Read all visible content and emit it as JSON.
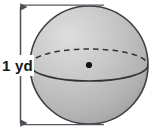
{
  "figure": {
    "kind": "geometry-diagram",
    "shape_name": "sphere",
    "background_color": "#ffffff",
    "dimension": {
      "label": "1 yd",
      "value": 1,
      "unit": "yd",
      "measures": "diameter",
      "orientation": "vertical",
      "arrowheads": "both",
      "line_color": "#4a4f55",
      "label_color": "#15171a"
    },
    "sphere": {
      "outline_color": "#3c4046",
      "fill_light": "#d8d8d8",
      "fill_mid": "#bdbdbd",
      "fill_dark": "#a6a6a6",
      "center_x": 89,
      "center_y": 65,
      "radius_x": 59,
      "radius_y": 59
    },
    "equator": {
      "back_arc_style": "dashed",
      "front_arc_style": "solid",
      "color": "#2f3338",
      "radius_x": 59,
      "radius_y": 16
    },
    "center_point": {
      "label": "center",
      "color": "#111315",
      "radius": 3
    }
  }
}
